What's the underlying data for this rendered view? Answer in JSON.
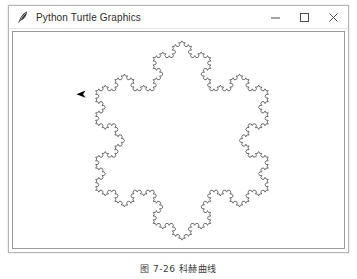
{
  "window": {
    "title": "Python Turtle Graphics",
    "icon": "feather-pen-icon",
    "controls": {
      "minimize_label": "─",
      "maximize_label": "□",
      "close_label": "✕",
      "minimize_name": "minimize",
      "maximize_name": "maximize",
      "close_name": "close"
    }
  },
  "canvas": {
    "background_color": "#ffffff",
    "stroke_color": "#4a4a4a",
    "turtle_color": "#000000",
    "border_color": "#9a9a9a"
  },
  "drawing": {
    "name": "koch-snowflake",
    "description": "Koch snowflake fractal",
    "depth": 4,
    "center_x": 182,
    "center_y": 141,
    "radius": 101,
    "turtle_x": 81,
    "turtle_y": 94,
    "turtle_heading": 180
  },
  "caption": {
    "text": "图 7-26  科赫曲线"
  }
}
